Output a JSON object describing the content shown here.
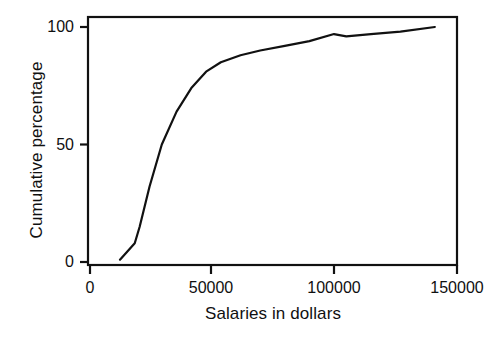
{
  "chart_data": {
    "type": "line",
    "title": "",
    "subtitle": "",
    "xlabel": "Salaries in dollars",
    "ylabel": "Cumulative percentage",
    "xlim": [
      0,
      150000
    ],
    "ylim": [
      0,
      103
    ],
    "xticks": [
      0,
      50000,
      100000,
      150000
    ],
    "xticklabels": [
      "0",
      "50000",
      "100000",
      "150000"
    ],
    "yticks": [
      0,
      50,
      100
    ],
    "yticklabels": [
      "0",
      "50",
      "100"
    ],
    "grid": false,
    "legend": false,
    "legend_position": "none",
    "line_color": "#111111",
    "line_width": 2,
    "frame": true,
    "series": [
      {
        "name": "Cumulative percentage",
        "x": [
          13000,
          19000,
          21000,
          25000,
          30000,
          36000,
          42000,
          48000,
          54000,
          62000,
          70000,
          80000,
          90000,
          100000,
          105000,
          115000,
          127000,
          141000
        ],
        "values": [
          1,
          8,
          15,
          32,
          50,
          64,
          74,
          81,
          85,
          88,
          90,
          92,
          94,
          97,
          96,
          97,
          98,
          100
        ]
      }
    ],
    "annotations": []
  },
  "figure": {
    "background": "#ffffff",
    "axis_color": "#111111"
  }
}
